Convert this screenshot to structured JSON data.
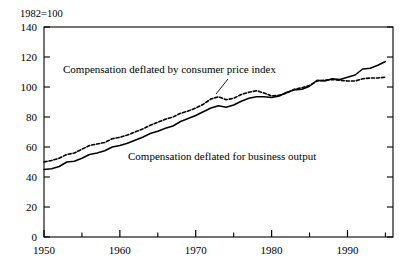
{
  "chart_data": {
    "type": "line",
    "title": "",
    "subtitle": "",
    "unit_note": "1982=100",
    "xlabel": "",
    "ylabel": "",
    "xlim": [
      1950,
      1996
    ],
    "ylim": [
      0,
      140
    ],
    "yticks": [
      0,
      20,
      40,
      60,
      80,
      100,
      120,
      140
    ],
    "ytick_labels": [
      "0",
      "20",
      "40",
      "60",
      "80",
      "100",
      "120",
      "140"
    ],
    "xticks_major": [
      1950,
      1960,
      1970,
      1980,
      1990
    ],
    "xtick_labels": [
      "1950",
      "1960",
      "1970",
      "1980",
      "1990"
    ],
    "xticks_minor": [
      1955,
      1965,
      1975,
      1985,
      1995
    ],
    "grid": false,
    "legend_position": "inline-annotations",
    "frame": "box",
    "tick_direction": "in",
    "x": [
      1950,
      1951,
      1952,
      1953,
      1954,
      1955,
      1956,
      1957,
      1958,
      1959,
      1960,
      1961,
      1962,
      1963,
      1964,
      1965,
      1966,
      1967,
      1968,
      1969,
      1970,
      1971,
      1972,
      1973,
      1974,
      1975,
      1976,
      1977,
      1978,
      1979,
      1980,
      1981,
      1982,
      1983,
      1984,
      1985,
      1986,
      1987,
      1988,
      1989,
      1990,
      1991,
      1992,
      1993,
      1994,
      1995
    ],
    "series": [
      {
        "name": "Compensation deflated by consumer price index",
        "style": "dashed",
        "color": "#000000",
        "values": [
          50,
          51,
          52.5,
          55,
          56,
          58.5,
          61,
          62,
          63,
          65.5,
          66.5,
          68,
          70,
          72,
          74.5,
          76.5,
          78.5,
          80,
          82.5,
          84,
          86,
          88.5,
          92,
          93.5,
          91.5,
          92.5,
          95,
          96.5,
          97.5,
          96,
          94,
          94.5,
          96,
          98.5,
          99.5,
          101,
          104,
          104.5,
          105,
          104.5,
          104,
          104,
          105.5,
          106,
          106,
          106.5
        ]
      },
      {
        "name": "Compensation deflated for business output",
        "style": "solid",
        "color": "#000000",
        "values": [
          45,
          45.5,
          47,
          50,
          50.5,
          52.5,
          55,
          56,
          57.5,
          60,
          61,
          62.5,
          64.5,
          66.5,
          69,
          70.5,
          72.5,
          74,
          77,
          79,
          81,
          83.5,
          86,
          87.5,
          86.5,
          88,
          90.5,
          92.5,
          93.5,
          93.5,
          93,
          94,
          96.5,
          98,
          98.5,
          100.5,
          104.5,
          104,
          105.5,
          105,
          106.5,
          108,
          112,
          112.5,
          114.5,
          117
        ]
      }
    ],
    "annotations": [
      {
        "text": "Compensation deflated by consumer price index",
        "x_px": 63,
        "y_px": 73,
        "leader": true
      },
      {
        "text": "Compensation deflated for business output",
        "x_px": 128,
        "y_px": 160,
        "leader": false
      }
    ]
  }
}
